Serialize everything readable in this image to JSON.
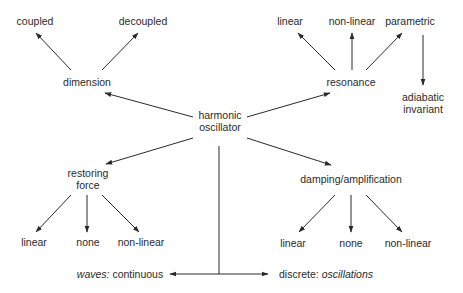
{
  "diagram": {
    "type": "concept-map",
    "colors": {
      "line": "#2a2a2a",
      "text": "#2a2a2a",
      "background": "#ffffff"
    },
    "root": {
      "line1": "harmonic",
      "line2": "oscillator"
    },
    "dimension": {
      "label": "dimension",
      "children": [
        "coupled",
        "decoupled"
      ]
    },
    "resonance": {
      "label": "resonance",
      "children": [
        "linear",
        "non-linear",
        "parametric"
      ],
      "parametric_child": {
        "line1": "adiabatic",
        "line2": "invariant"
      }
    },
    "restoring_force": {
      "line1": "restoring",
      "line2": "force",
      "children": [
        "linear",
        "none",
        "non-linear"
      ]
    },
    "damping": {
      "label": "damping/amplification",
      "children": [
        "linear",
        "none",
        "non-linear"
      ]
    },
    "bottom": {
      "left_italic": "waves:",
      "left_text": " continuous",
      "right_text": "discrete: ",
      "right_italic": "oscillations"
    }
  }
}
